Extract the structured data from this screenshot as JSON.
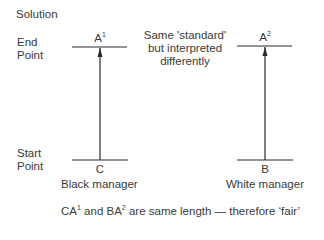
{
  "title": "Solution",
  "axis_labels": {
    "end_line1": "End",
    "end_line2": "Point",
    "start_line1": "Start",
    "start_line2": "Point"
  },
  "note": {
    "line1": "Same 'standard'",
    "line2": "but interpreted",
    "line3": "differently"
  },
  "left": {
    "top_label": "A",
    "top_sup": "1",
    "bottom_label": "C",
    "caption": "Black manager"
  },
  "right": {
    "top_label": "A",
    "top_sup": "2",
    "bottom_label": "B",
    "caption": "White manager"
  },
  "conclusion": {
    "p1": "CA",
    "s1": "1",
    "p2": " and BA",
    "s2": "2",
    "p3": " are same length — therefore ‘fair’"
  },
  "colors": {
    "ink": "#3a3a3a",
    "line": "#2a2a2a"
  }
}
